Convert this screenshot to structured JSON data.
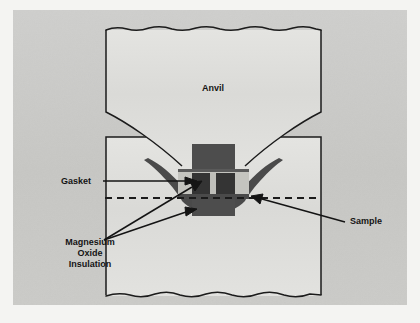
{
  "figure": {
    "type": "cross-section-schematic",
    "background_color": "#f2f2f0",
    "panel_color": "#c9c9c7",
    "panel_rect": {
      "x": 13,
      "y": 10,
      "width": 394,
      "height": 295
    },
    "line_color": "#1b1b1b",
    "anvil_fill": "#dcdcd9",
    "gasket_fill": "#4a4a4a",
    "insulation_fill": "#4d4d4d",
    "sample_fill": "#3a3a3a",
    "highlight_fill": "#c7c7c2"
  },
  "labels": {
    "anvil": {
      "text": "Anvil",
      "x": 213,
      "y": 91,
      "font_size": 9,
      "anchor": "middle"
    },
    "gasket": {
      "text": "Gasket",
      "x": 61,
      "y": 184,
      "font_size": 9,
      "anchor": "start"
    },
    "sample": {
      "text": "Sample",
      "x": 350,
      "y": 224,
      "font_size": 9,
      "anchor": "start"
    },
    "insulation": {
      "lines": [
        "Magnesium",
        "Oxide",
        "Insulation"
      ],
      "x": 90,
      "y": 245,
      "line_height": 11,
      "font_size": 9,
      "anchor": "middle"
    }
  },
  "annotations": {
    "leader_lines": [
      {
        "name": "gasket-leader",
        "from": [
          105,
          181
        ],
        "to": [
          193,
          181
        ]
      },
      {
        "name": "sample-leader",
        "from": [
          345,
          221
        ],
        "to": [
          254,
          198
        ]
      },
      {
        "name": "insulation-leader-upper",
        "from": [
          104,
          240
        ],
        "to": [
          196,
          184
        ]
      },
      {
        "name": "insulation-leader-lower",
        "from": [
          104,
          240
        ],
        "to": [
          195,
          210
        ]
      }
    ],
    "centerline": {
      "name": "axis-centerline",
      "from": [
        105,
        198
      ],
      "to": [
        318,
        198
      ],
      "dash": "7 5",
      "width": 2.2
    }
  },
  "geometry": {
    "upper_anvil_path": "M 106 30 L 106 112 C 124 120 152 138 180 163 L 180 170 L 247 170 L 247 163 C 275 138 303 120 321 112 L 321 30 Z",
    "upper_anvil_torn_top": "M 106 30 Q 116 26 127 29 Q 138 32 149 28 Q 161 25 172 29 Q 184 32 196 28 Q 208 25 220 29 Q 233 32 245 28 Q 257 25 269 29 Q 281 32 293 28 Q 305 25 316 29 L 321 30",
    "lower_anvil_torn_bottom": "M 106 296 Q 118 292 130 295 Q 142 299 155 294 Q 168 290 180 295 Q 193 299 206 294 Q 219 290 232 295 Q 245 299 258 294 Q 271 290 284 295 Q 297 299 310 294 L 321 295",
    "gasket_left": "M 180 163 C 182 170 186 180 192 188 C 196 194 199 198 200 201 L 186 201 C 182 196 176 188 168 179 C 160 170 152 163 146 159 Z",
    "gasket_right": "M 247 163 C 245 170 241 180 235 188 C 231 194 228 198 227 201 L 241 201 C 245 196 251 188 259 179 C 267 170 275 163 281 159 Z",
    "insulation_block": {
      "x": 192,
      "y": 144,
      "width": 43,
      "height": 72
    },
    "sample_band": {
      "x": 178,
      "y": 170,
      "width": 71,
      "height": 28
    },
    "sample_core": {
      "x": 192,
      "y": 173,
      "width": 43,
      "height": 21
    },
    "sample_slit": {
      "x": 210,
      "y": 173,
      "width": 5,
      "height": 21
    }
  }
}
